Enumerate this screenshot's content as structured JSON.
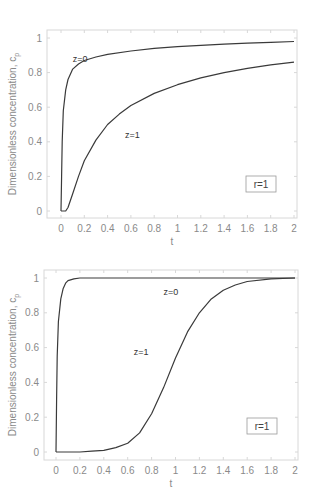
{
  "chart_data": [
    {
      "type": "line",
      "title": "",
      "xlabel": "t",
      "ylabel": "Dimensionless concentration, c_p",
      "xlim": [
        0,
        2
      ],
      "ylim": [
        0,
        1
      ],
      "x_ticks": [
        "0",
        "0.2",
        "0.4",
        "0.6",
        "0.8",
        "1",
        "1.2",
        "1.4",
        "1.6",
        "1.8",
        "2"
      ],
      "y_ticks": [
        "0",
        "0.2",
        "0.4",
        "0.6",
        "0.8",
        "1"
      ],
      "grid": false,
      "legend_box": "r=1",
      "series": [
        {
          "name": "z=0",
          "x": [
            0,
            0.005,
            0.01,
            0.02,
            0.04,
            0.06,
            0.1,
            0.15,
            0.2,
            0.3,
            0.4,
            0.6,
            0.8,
            1.0,
            1.2,
            1.4,
            1.6,
            1.8,
            2.0
          ],
          "y": [
            0,
            0.2,
            0.4,
            0.58,
            0.7,
            0.76,
            0.82,
            0.85,
            0.87,
            0.89,
            0.905,
            0.925,
            0.94,
            0.95,
            0.958,
            0.965,
            0.97,
            0.975,
            0.98
          ]
        },
        {
          "name": "z=1",
          "x": [
            0,
            0.04,
            0.06,
            0.1,
            0.15,
            0.2,
            0.3,
            0.4,
            0.5,
            0.6,
            0.8,
            1.0,
            1.2,
            1.4,
            1.6,
            1.8,
            2.0
          ],
          "y": [
            0,
            0,
            0.02,
            0.1,
            0.2,
            0.29,
            0.41,
            0.5,
            0.56,
            0.61,
            0.68,
            0.73,
            0.77,
            0.8,
            0.825,
            0.845,
            0.86
          ]
        }
      ],
      "annotations": [
        {
          "text": "z=0",
          "x": 0.1,
          "y": 0.86
        },
        {
          "text": "z=1",
          "x": 0.55,
          "y": 0.42
        }
      ]
    },
    {
      "type": "line",
      "title": "",
      "xlabel": "t",
      "ylabel": "Dimensionless concentration, c_p",
      "xlim": [
        0,
        2
      ],
      "ylim": [
        0,
        1
      ],
      "x_ticks": [
        "0",
        "0.2",
        "0.4",
        "0.6",
        "0.8",
        "1",
        "1.2",
        "1.4",
        "1.6",
        "1.8",
        "2"
      ],
      "y_ticks": [
        "0",
        "0.2",
        "0.4",
        "0.6",
        "0.8",
        "1"
      ],
      "grid": false,
      "legend_box": "r=1",
      "series": [
        {
          "name": "z=0",
          "x": [
            0,
            0.005,
            0.01,
            0.02,
            0.04,
            0.06,
            0.08,
            0.1,
            0.15,
            0.2,
            0.4,
            1.0,
            2.0
          ],
          "y": [
            0,
            0.3,
            0.55,
            0.75,
            0.88,
            0.94,
            0.97,
            0.985,
            0.995,
            1.0,
            1.0,
            1.0,
            1.0
          ]
        },
        {
          "name": "z=1",
          "x": [
            0,
            0.2,
            0.3,
            0.4,
            0.5,
            0.6,
            0.7,
            0.8,
            0.9,
            1.0,
            1.1,
            1.2,
            1.3,
            1.4,
            1.5,
            1.6,
            1.8,
            2.0
          ],
          "y": [
            0,
            0,
            0.005,
            0.01,
            0.025,
            0.05,
            0.11,
            0.22,
            0.37,
            0.54,
            0.69,
            0.8,
            0.88,
            0.93,
            0.96,
            0.98,
            0.995,
            1.0
          ]
        }
      ],
      "annotations": [
        {
          "text": "z=0",
          "x": 0.9,
          "y": 0.9
        },
        {
          "text": "z=1",
          "x": 0.65,
          "y": 0.56
        }
      ]
    }
  ],
  "layout": {
    "charts": [
      {
        "x0": 61,
        "x1": 294,
        "y0": 211,
        "y1": 38,
        "frame": [
          47,
          30,
          297,
          218
        ],
        "legend": [
          246,
          176,
          30,
          16
        ]
      },
      {
        "x0": 56,
        "x1": 295,
        "y0": 452,
        "y1": 278,
        "frame": [
          44,
          270,
          298,
          460
        ],
        "legend": [
          247,
          418,
          30,
          16
        ]
      }
    ],
    "colors": {
      "line": "#3a3a3a",
      "frame": "#d8d8d8",
      "tick_text": "#8a8a8a"
    }
  }
}
